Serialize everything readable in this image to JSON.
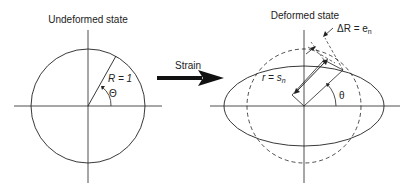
{
  "left": {
    "title": "Undeformed state",
    "radius_label": "R = 1",
    "angle_label": "Θ"
  },
  "arrow": {
    "label": "Strain"
  },
  "right": {
    "title": "Deformed state",
    "delta_label": "ΔR = e",
    "delta_sub": "n",
    "r_label": "r = s",
    "r_sub": "n",
    "angle_label": "θ"
  }
}
